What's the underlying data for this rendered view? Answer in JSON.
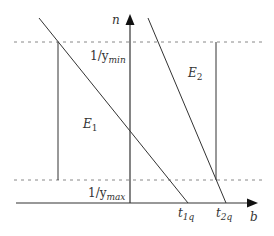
{
  "diagram": {
    "axes": {
      "y_label": "n",
      "x_label": "b"
    },
    "levels": {
      "upper": {
        "label_main": "1/y",
        "label_sub": "min"
      },
      "lower": {
        "label_main": "1/y",
        "label_sub": "max"
      }
    },
    "regions": [
      {
        "label_main": "E",
        "label_sub": "1"
      },
      {
        "label_main": "E",
        "label_sub": "2"
      }
    ],
    "x_ticks": [
      {
        "label_main": "t",
        "label_sub": "1q"
      },
      {
        "label_main": "t",
        "label_sub": "2q"
      }
    ],
    "colors": {
      "line": "#333333",
      "dashed": "#888888"
    }
  }
}
